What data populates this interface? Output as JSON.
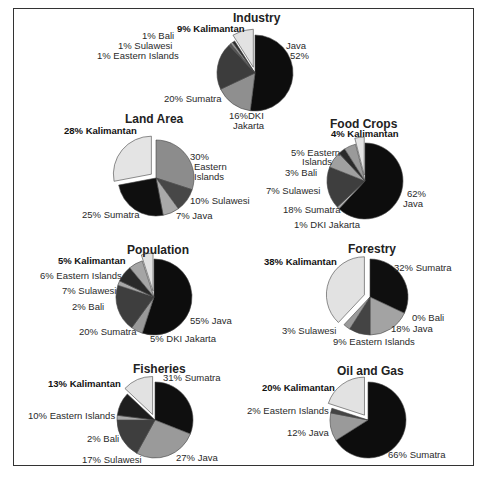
{
  "chart_data": [
    {
      "type": "pie",
      "title": "Industry",
      "center": [
        255,
        73
      ],
      "radius": 38,
      "slices": [
        {
          "label": "Java",
          "value": 52,
          "color": "#0d0d0d"
        },
        {
          "label": "DKI Jakarta",
          "value": 16,
          "color": "#8f8f8f"
        },
        {
          "label": "Sumatra",
          "value": 20,
          "color": "#3c3c3c"
        },
        {
          "label": "Eastern Islands",
          "value": 1,
          "color": "#555555"
        },
        {
          "label": "Sulawesi",
          "value": 1,
          "color": "#999999"
        },
        {
          "label": "Bali",
          "value": 1,
          "color": "#2a2a2a"
        },
        {
          "label": "Kalimantan",
          "value": 9,
          "color": "#e2e2e2",
          "exploded": true
        }
      ],
      "labels": {
        "kalimantan": "9% Kalimantan",
        "bali": "1% Bali",
        "sulawesi": "1% Sulawesi",
        "eastern": "1% Eastern Islands",
        "java_name": "Java",
        "java_pct": "52%",
        "sumatra": "20% Sumatra",
        "dki_pct": "16%DKI",
        "dki_name": "Jakarta"
      }
    },
    {
      "type": "pie",
      "title": "Land Area",
      "center": [
        156,
        178
      ],
      "radius": 38,
      "slices": [
        {
          "label": "Eastern Islands",
          "value": 30,
          "color": "#8c8c8c"
        },
        {
          "label": "Sulawesi",
          "value": 10,
          "color": "#474747"
        },
        {
          "label": "Java",
          "value": 7,
          "color": "#a9a9a9"
        },
        {
          "label": "Sumatra",
          "value": 25,
          "color": "#0f0f0f"
        },
        {
          "label": "Kalimantan",
          "value": 28,
          "color": "#e4e4e4",
          "exploded": true
        }
      ],
      "labels": {
        "kalimantan": "28% Kalimantan",
        "eastern_pct": "30%",
        "eastern_1": "Eastern",
        "eastern_2": "Islands",
        "sulawesi": "10% Sulawesi",
        "java": "7% Java",
        "sumatra": "25% Sumatra"
      }
    },
    {
      "type": "pie",
      "title": "Food Crops",
      "center": [
        365,
        181
      ],
      "radius": 38,
      "slices": [
        {
          "label": "Java",
          "value": 62,
          "color": "#0d0d0d"
        },
        {
          "label": "DKI Jakarta",
          "value": 1,
          "color": "#b5b5b5"
        },
        {
          "label": "Sumatra",
          "value": 18,
          "color": "#3e3e3e"
        },
        {
          "label": "Sulawesi",
          "value": 7,
          "color": "#a0a0a0"
        },
        {
          "label": "Bali",
          "value": 3,
          "color": "#2a2a2a"
        },
        {
          "label": "Eastern Islands",
          "value": 5,
          "color": "#9a9a9a"
        },
        {
          "label": "Kalimantan",
          "value": 4,
          "color": "#e2e2e2",
          "exploded": true
        }
      ],
      "labels": {
        "kalimantan": "4% Kalimantan",
        "eastern_1": "5% Eastern",
        "eastern_2": "Islands",
        "bali": "3% Bali",
        "sulawesi": "7% Sulawesi",
        "sumatra": "18% Sumatra",
        "dki": "1% DKI Jakarta",
        "java_pct": "62%",
        "java_name": "Java"
      }
    },
    {
      "type": "pie",
      "title": "Population",
      "center": [
        154,
        297
      ],
      "radius": 38,
      "slices": [
        {
          "label": "Java",
          "value": 55,
          "color": "#0d0d0d"
        },
        {
          "label": "DKI Jakarta",
          "value": 5,
          "color": "#999999"
        },
        {
          "label": "Sumatra",
          "value": 20,
          "color": "#3e3e3e"
        },
        {
          "label": "Bali",
          "value": 2,
          "color": "#a8a8a8"
        },
        {
          "label": "Sulawesi",
          "value": 7,
          "color": "#2a2a2a"
        },
        {
          "label": "Eastern Islands",
          "value": 6,
          "color": "#a5a5a5"
        },
        {
          "label": "Kalimantan",
          "value": 5,
          "color": "#e2e2e2",
          "exploded": true
        }
      ],
      "labels": {
        "kalimantan": "5% Kalimantan",
        "eastern": "6% Eastern Islands",
        "sulawesi": "7% Sulawesi",
        "bali": "2% Bali",
        "sumatra": "20% Sumatra",
        "dki": "5% DKI Jakarta",
        "java": "55% Java"
      }
    },
    {
      "type": "pie",
      "title": "Forestry",
      "center": [
        370,
        297
      ],
      "radius": 38,
      "slices": [
        {
          "label": "Sumatra",
          "value": 32,
          "color": "#0f0f0f"
        },
        {
          "label": "Bali",
          "value": 0,
          "color": "#777777"
        },
        {
          "label": "Java",
          "value": 18,
          "color": "#a3a3a3"
        },
        {
          "label": "Eastern Islands",
          "value": 9,
          "color": "#444444"
        },
        {
          "label": "Sulawesi",
          "value": 3,
          "color": "#9a9a9a"
        },
        {
          "label": "Kalimantan",
          "value": 38,
          "color": "#e2e2e2",
          "exploded": true
        }
      ],
      "labels": {
        "kalimantan": "38% Kalimantan",
        "sumatra": "32% Sumatra",
        "bali": "0% Bali",
        "java": "18% Java",
        "sulawesi": "3% Sulawesi",
        "eastern": "9% Eastern Islands"
      }
    },
    {
      "type": "pie",
      "title": "Fisheries",
      "center": [
        155,
        420
      ],
      "radius": 38,
      "slices": [
        {
          "label": "Sumatra",
          "value": 31,
          "color": "#0f0f0f"
        },
        {
          "label": "Java",
          "value": 27,
          "color": "#9a9a9a"
        },
        {
          "label": "Sulawesi",
          "value": 17,
          "color": "#3e3e3e"
        },
        {
          "label": "Bali",
          "value": 2,
          "color": "#a8a8a8"
        },
        {
          "label": "Eastern Islands",
          "value": 10,
          "color": "#1e1e1e"
        },
        {
          "label": "Kalimantan",
          "value": 13,
          "color": "#e2e2e2",
          "exploded": true
        }
      ],
      "labels": {
        "kalimantan": "13% Kalimantan",
        "sumatra": "31% Sumatra",
        "eastern": "10% Eastern Islands",
        "bali": "2% Bali",
        "sulawesi": "17% Sulawesi",
        "java": "27% Java"
      }
    },
    {
      "type": "pie",
      "title": "Oil and Gas",
      "center": [
        368,
        420
      ],
      "radius": 38,
      "slices": [
        {
          "label": "Sumatra",
          "value": 66,
          "color": "#0d0d0d"
        },
        {
          "label": "Java",
          "value": 12,
          "color": "#9a9a9a"
        },
        {
          "label": "Eastern Islands",
          "value": 2,
          "color": "#444444"
        },
        {
          "label": "Kalimantan",
          "value": 20,
          "color": "#e2e2e2",
          "exploded": true
        }
      ],
      "labels": {
        "kalimantan": "20% Kalimantan",
        "eastern": "2% Eastern Islands",
        "java": "12% Java",
        "sumatra": "66% Sumatra"
      }
    }
  ]
}
